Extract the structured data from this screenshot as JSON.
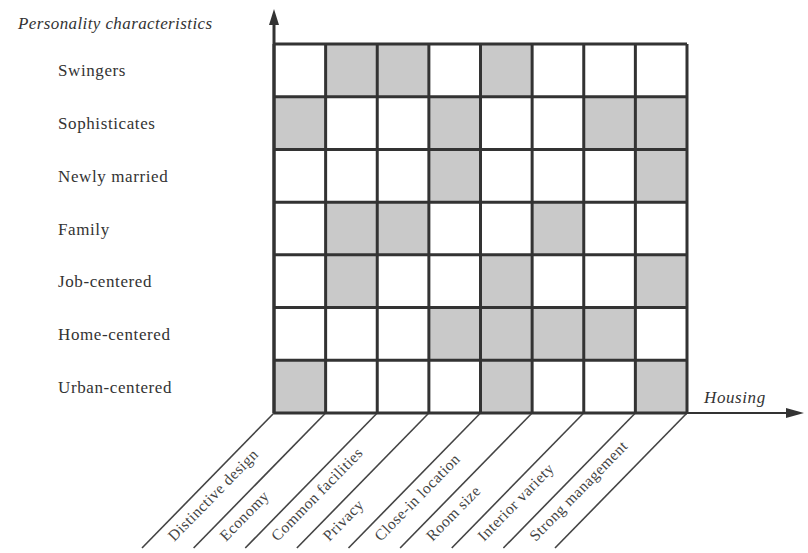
{
  "diagram": {
    "y_axis_title": "Personality characteristics",
    "x_axis_title": "Housing",
    "rows": [
      "Swingers",
      "Sophisticates",
      "Newly married",
      "Family",
      "Job-centered",
      "Home-centered",
      "Urban-centered"
    ],
    "columns": [
      "Distinctive design",
      "Economy",
      "Common facilities",
      "Privacy",
      "Close-in location",
      "Room size",
      "Interior variety",
      "Strong management"
    ],
    "shaded_cells": [
      [
        0,
        1,
        1,
        0,
        1,
        0,
        0,
        0
      ],
      [
        1,
        0,
        0,
        1,
        0,
        0,
        1,
        1
      ],
      [
        0,
        0,
        0,
        1,
        0,
        0,
        0,
        1
      ],
      [
        0,
        1,
        1,
        0,
        0,
        1,
        0,
        0
      ],
      [
        0,
        1,
        0,
        0,
        1,
        0,
        0,
        1
      ],
      [
        0,
        0,
        0,
        1,
        1,
        1,
        1,
        0
      ],
      [
        1,
        0,
        0,
        0,
        1,
        0,
        0,
        1
      ]
    ],
    "colors": {
      "shade": "#c9c9c9",
      "grid_line": "#333333",
      "background": "#ffffff"
    }
  }
}
